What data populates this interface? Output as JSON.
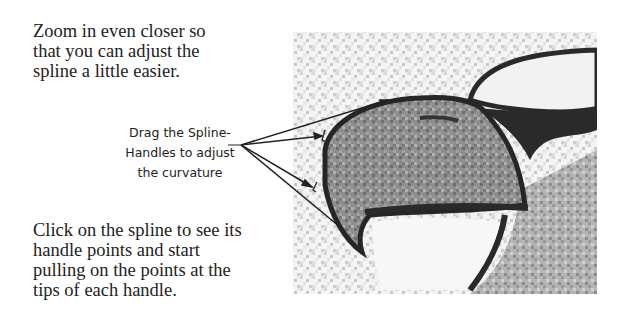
{
  "instructions": {
    "top": "Zoom in even closer so that you can adjust the spline a little easier.",
    "bottom": "Click on the spline to see its handle points and start pulling on the points at the tips of each handle."
  },
  "callout": {
    "lines": [
      "Drag the Spline-",
      "Handles to adjust",
      "the curvature"
    ]
  },
  "illustration": {
    "subject": "eagle-beak-spline",
    "pointer_arrows": 4,
    "colors": {
      "ink": "#222222",
      "beak_fill": "#8a8a8a",
      "background": "#ffffff"
    }
  }
}
